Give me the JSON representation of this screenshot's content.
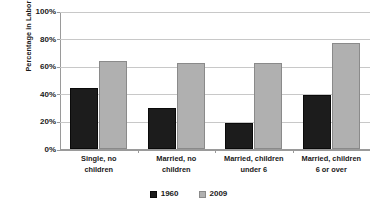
{
  "chart_data": {
    "type": "bar",
    "title": "",
    "subtitle": "",
    "xlabel": "",
    "ylabel": "Percentage in Labor Force",
    "ylim": [
      0,
      100
    ],
    "ytick_labels": [
      "0%",
      "20%",
      "40%",
      "60%",
      "80%",
      "100%"
    ],
    "ytick_values": [
      0,
      20,
      40,
      60,
      80,
      100
    ],
    "grid": true,
    "legend_position": "bottom",
    "categories": [
      "Single, no children",
      "Married, no children",
      "Married, children under 6",
      "Married, children 6 or over"
    ],
    "category_lines": [
      [
        "Single, no",
        "children"
      ],
      [
        "Married, no",
        "children"
      ],
      [
        "Married, children",
        "under 6"
      ],
      [
        "Married, children",
        "6 or over"
      ]
    ],
    "series": [
      {
        "name": "1960",
        "color": "#1c1c1c",
        "values": [
          44,
          30,
          19,
          39
        ]
      },
      {
        "name": "2009",
        "color": "#b0b0b0",
        "values": [
          64,
          62,
          62,
          77
        ]
      }
    ]
  },
  "legend": {
    "items": [
      {
        "label": "1960",
        "color": "#1c1c1c"
      },
      {
        "label": "2009",
        "color": "#b0b0b0"
      }
    ]
  },
  "colors": {
    "background": "#ffffff",
    "gridline": "#c8c8c8",
    "axis": "#9a9a9a",
    "text": "#1a1a1a",
    "series_1960": "#1c1c1c",
    "series_2009": "#b0b0b0"
  }
}
